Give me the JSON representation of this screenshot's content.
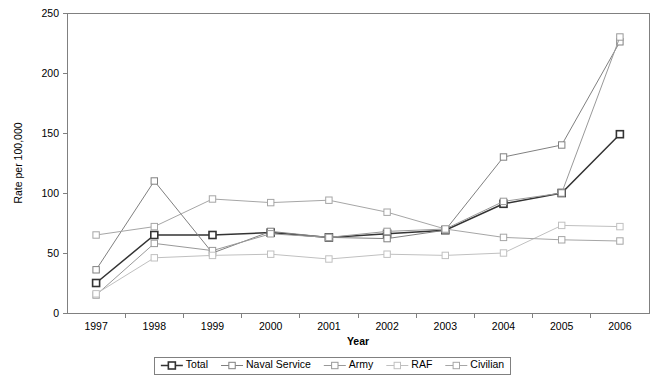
{
  "chart_data": {
    "type": "line",
    "title": "",
    "xlabel": "Year",
    "ylabel": "Rate per 100,000",
    "categories": [
      "1997",
      "1998",
      "1999",
      "2000",
      "2001",
      "2002",
      "2003",
      "2004",
      "2005",
      "2006"
    ],
    "x": [
      1997,
      1998,
      1999,
      2000,
      2001,
      2002,
      2003,
      2004,
      2005,
      2006
    ],
    "ylim": [
      0,
      250
    ],
    "yticks": [
      0,
      50,
      100,
      150,
      200,
      250
    ],
    "grid": false,
    "legend_position": "bottom",
    "series": [
      {
        "name": "Total",
        "color": "#333333",
        "values": [
          25,
          65,
          65,
          67,
          63,
          66,
          69,
          91,
          100,
          149
        ]
      },
      {
        "name": "Naval Service",
        "color": "#808080",
        "values": [
          36,
          110,
          50,
          68,
          63,
          62,
          69,
          130,
          140,
          226
        ]
      },
      {
        "name": "Army",
        "color": "#999999",
        "values": [
          15,
          58,
          52,
          66,
          63,
          68,
          70,
          93,
          100,
          230
        ]
      },
      {
        "name": "RAF",
        "color": "#c0c0c0",
        "values": [
          16,
          46,
          48,
          49,
          45,
          49,
          48,
          50,
          73,
          72
        ]
      },
      {
        "name": "Civilian",
        "color": "#a6a6a6",
        "values": [
          65,
          72,
          95,
          92,
          94,
          84,
          70,
          63,
          61,
          60
        ]
      }
    ]
  },
  "legend": {
    "items": [
      {
        "label": "Total"
      },
      {
        "label": "Naval Service"
      },
      {
        "label": "Army"
      },
      {
        "label": "RAF"
      },
      {
        "label": "Civilian"
      }
    ]
  }
}
